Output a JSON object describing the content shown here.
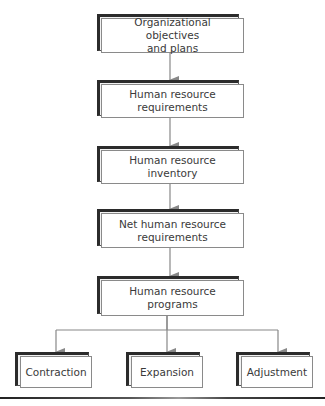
{
  "diagram": {
    "type": "flowchart",
    "colors": {
      "box_border": "#8a8a8a",
      "shadow": "#2b2b2b",
      "arrow": "#888888",
      "text": "#3a3a3a"
    },
    "nodes": [
      {
        "id": "objectives",
        "line1": "Organizational objectives",
        "line2": "and plans"
      },
      {
        "id": "requirements",
        "line1": "Human resource",
        "line2": "requirements"
      },
      {
        "id": "inventory",
        "line1": "Human resource",
        "line2": "inventory"
      },
      {
        "id": "net_requirements",
        "line1": "Net human resource",
        "line2": "requirements"
      },
      {
        "id": "programs",
        "line1": "Human resource",
        "line2": "programs"
      },
      {
        "id": "contraction",
        "line1": "Contraction"
      },
      {
        "id": "expansion",
        "line1": "Expansion"
      },
      {
        "id": "adjustment",
        "line1": "Adjustment"
      }
    ],
    "edges": [
      [
        "objectives",
        "requirements"
      ],
      [
        "requirements",
        "inventory"
      ],
      [
        "inventory",
        "net_requirements"
      ],
      [
        "net_requirements",
        "programs"
      ],
      [
        "programs",
        "contraction"
      ],
      [
        "programs",
        "expansion"
      ],
      [
        "programs",
        "adjustment"
      ]
    ]
  }
}
